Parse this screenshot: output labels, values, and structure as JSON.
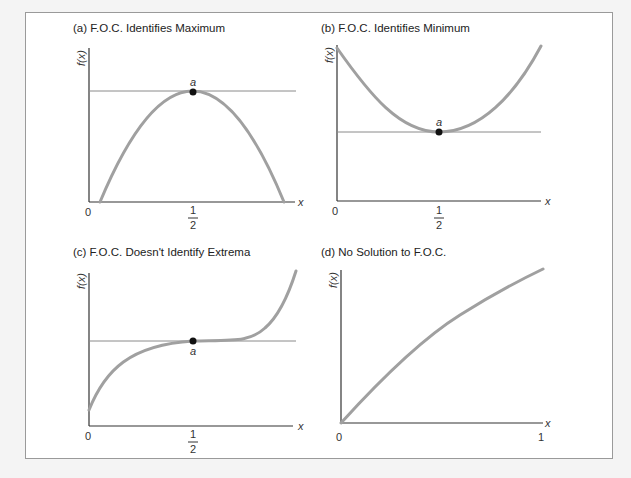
{
  "panels": [
    {
      "id": "a",
      "title": "(a) F.O.C. Identifies Maximum",
      "ylabel": "f(x)",
      "xlabel": "x",
      "x_ticks": [
        "0",
        "1",
        "2"
      ],
      "point_label": "a"
    },
    {
      "id": "b",
      "title": "(b) F.O.C. Identifies Minimum",
      "ylabel": "f(x)",
      "xlabel": "x",
      "x_ticks": [
        "0",
        "1",
        "2"
      ],
      "point_label": "a"
    },
    {
      "id": "c",
      "title": "(c) F.O.C. Doesn't Identify Extrema",
      "ylabel": "f(x)",
      "xlabel": "x",
      "x_ticks": [
        "0",
        "1",
        "2"
      ],
      "point_label": "a"
    },
    {
      "id": "d",
      "title": "(d) No Solution to F.O.C.",
      "ylabel": "f(x)",
      "xlabel": "x",
      "x_ticks": [
        "0",
        "1"
      ]
    }
  ],
  "colors": {
    "curve": "#a0a0a0",
    "axis": "#333333",
    "tangent_line": "#8a8a8a",
    "point": "#111111"
  }
}
